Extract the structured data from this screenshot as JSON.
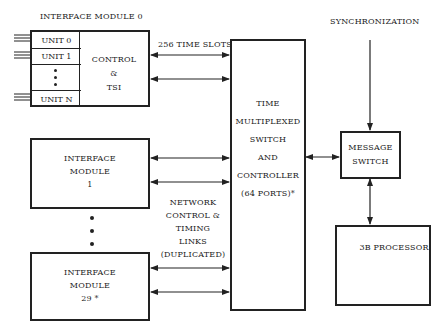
{
  "interface_module_0": {
    "title": "INTERFACE MODULE 0",
    "units": [
      "UNIT 0",
      "UNIT 1",
      "UNIT N"
    ],
    "control_lines": [
      "CONTROL",
      "&",
      "TSI"
    ]
  },
  "link_labels": {
    "time_slots": "256 TIME SLOTS",
    "network": [
      "NETWORK",
      "CONTROL &",
      "TIMING",
      "LINKS",
      "(DUPLICATED)"
    ]
  },
  "interface_module_1": {
    "lines": [
      "INTERFACE",
      "MODULE",
      "1"
    ]
  },
  "interface_module_29": {
    "lines": [
      "INTERFACE",
      "MODULE",
      "29 *"
    ]
  },
  "tms": {
    "lines": [
      "TIME",
      "MULTIPLEXED",
      "SWITCH",
      "AND",
      "CONTROLLER",
      "(64 PORTS)*"
    ]
  },
  "synchronization": "SYNCHRONIZATION",
  "message_switch": {
    "lines": [
      "MESSAGE",
      "SWITCH"
    ]
  },
  "processor": "3B PROCESSOR",
  "colors": {
    "line": "#222222",
    "background": "#ffffff"
  }
}
